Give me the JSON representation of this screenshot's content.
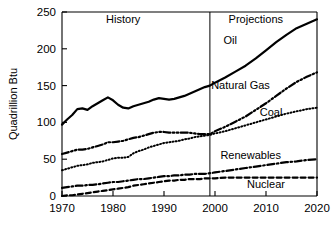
{
  "chart_data": {
    "type": "line",
    "title": "",
    "subtitle": "",
    "xlabel": "",
    "ylabel": "Quadrillion Btu",
    "xlim": [
      1970,
      2020
    ],
    "ylim": [
      0,
      250
    ],
    "grid": false,
    "legend_position": "inline-labels",
    "x_ticks": [
      "1970",
      "1980",
      "1990",
      "2000",
      "2010",
      "2020"
    ],
    "x_tick_values": [
      1970,
      1980,
      1990,
      2000,
      2010,
      2020
    ],
    "y_ticks": [
      "0",
      "50",
      "100",
      "150",
      "200",
      "250"
    ],
    "y_tick_values": [
      0,
      50,
      100,
      150,
      200,
      250
    ],
    "annotations": [
      {
        "name": "history-label",
        "text": "History",
        "x": 1982,
        "y": 240
      },
      {
        "name": "projections-label",
        "text": "Projections",
        "x": 2008,
        "y": 240
      }
    ],
    "divider": {
      "name": "history-projection-divider",
      "x": 1999,
      "label": "1999"
    },
    "x": [
      1970,
      1971,
      1972,
      1973,
      1974,
      1975,
      1976,
      1977,
      1978,
      1979,
      1980,
      1981,
      1982,
      1983,
      1984,
      1985,
      1986,
      1987,
      1988,
      1989,
      1990,
      1991,
      1992,
      1993,
      1994,
      1995,
      1996,
      1997,
      1998,
      1999,
      2000,
      2002,
      2004,
      2006,
      2008,
      2010,
      2012,
      2014,
      2016,
      2018,
      2020
    ],
    "series": [
      {
        "name": "Oil",
        "label": "Oil",
        "style": "solid",
        "width": 2.2,
        "color": "#000000",
        "label_x": 2003,
        "label_y": 212,
        "values": [
          97,
          104,
          110,
          118,
          119,
          117,
          122,
          126,
          130,
          134,
          130,
          124,
          120,
          119,
          122,
          124,
          126,
          128,
          131,
          133,
          132,
          131,
          132,
          134,
          136,
          139,
          142,
          145,
          148,
          150,
          154,
          161,
          169,
          177,
          187,
          198,
          209,
          219,
          228,
          234,
          240
        ]
      },
      {
        "name": "Natural Gas",
        "label": "Natural Gas",
        "style": "dashdotdot",
        "width": 2.2,
        "color": "#000000",
        "label_x": 2005,
        "label_y": 151,
        "values": [
          57,
          59,
          61,
          63,
          63,
          64,
          66,
          68,
          70,
          73,
          73,
          74,
          75,
          77,
          79,
          80,
          82,
          84,
          86,
          87,
          87,
          86,
          86,
          86,
          86,
          86,
          85,
          84,
          84,
          84,
          88,
          94,
          101,
          108,
          117,
          126,
          136,
          146,
          155,
          162,
          168
        ]
      },
      {
        "name": "Coal",
        "label": "Coal",
        "style": "dotted",
        "width": 2.0,
        "color": "#000000",
        "label_x": 2011,
        "label_y": 114,
        "values": [
          35,
          37,
          39,
          41,
          42,
          43,
          45,
          46,
          47,
          49,
          51,
          52,
          52,
          53,
          58,
          61,
          63,
          66,
          68,
          70,
          72,
          73,
          74,
          75,
          77,
          78,
          80,
          81,
          82,
          83,
          85,
          88,
          92,
          96,
          100,
          104,
          108,
          112,
          115,
          118,
          120
        ]
      },
      {
        "name": "Renewables",
        "label": "Renewables",
        "style": "dashdot",
        "width": 2.2,
        "color": "#000000",
        "label_x": 2007,
        "label_y": 56,
        "values": [
          11,
          12,
          13,
          14,
          14,
          15,
          15,
          16,
          17,
          18,
          19,
          19,
          20,
          21,
          22,
          23,
          23,
          24,
          25,
          26,
          27,
          27,
          28,
          28,
          29,
          29,
          30,
          30,
          30,
          31,
          32,
          34,
          36,
          38,
          40,
          42,
          44,
          46,
          47,
          49,
          50
        ]
      },
      {
        "name": "Nuclear",
        "label": "Nuclear",
        "style": "dashed",
        "width": 2.2,
        "color": "#000000",
        "label_x": 2010,
        "label_y": 16,
        "values": [
          0,
          1,
          1,
          2,
          3,
          4,
          5,
          6,
          7,
          8,
          9,
          10,
          11,
          12,
          14,
          15,
          16,
          17,
          18,
          19,
          20,
          21,
          21,
          22,
          22,
          23,
          23,
          23,
          24,
          24,
          24,
          25,
          25,
          25,
          25,
          25,
          25,
          25,
          25,
          25,
          25
        ]
      }
    ]
  },
  "axes": {
    "y_axis_title": "Quadrillion Btu"
  }
}
